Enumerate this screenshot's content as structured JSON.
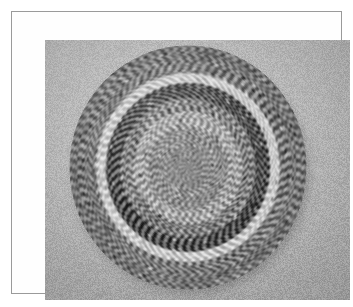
{
  "plate": {
    "kind": "photographic-plate",
    "caption": "",
    "frame_color": "#9a9a9a",
    "matte_color": "#fefefe",
    "photo_background_color": "#b2b2b2",
    "photo_rect": {
      "x": 33,
      "y": 28,
      "width": 305,
      "height": 260
    }
  },
  "subject": {
    "name": "braided-round-rug",
    "description": "Black-and-white photograph of a circular braided rag rug lying flat on a plain light-gray ground, viewed slightly from above so the disc reads as a wide ellipse.",
    "shape": "circle",
    "center": {
      "x": 176,
      "y": 155
    },
    "radius_x": 119,
    "radius_y": 122,
    "texture": "dense alternating light/dark braided chevron stitches running radially, giving a checkerboard speckle",
    "tone_range": {
      "darkest": "#141414",
      "lightest": "#f2f2f2",
      "mid": "#8d8d8d"
    }
  },
  "rug_bands": [
    {
      "index": 0,
      "name": "center-rosette",
      "r_inner": 0.0,
      "r_outer": 0.18,
      "tone": 0.52,
      "contrast": 0.3,
      "cell": 2.6,
      "label": "fine mottled gray hub"
    },
    {
      "index": 1,
      "name": "inner-mid-ring",
      "r_inner": 0.18,
      "r_outer": 0.34,
      "tone": 0.55,
      "contrast": 0.46,
      "cell": 3.2,
      "label": "light-gray speckled ring"
    },
    {
      "index": 2,
      "name": "inner-light-ring",
      "r_inner": 0.34,
      "r_outer": 0.46,
      "tone": 0.66,
      "contrast": 0.52,
      "cell": 3.4,
      "label": "pale ring with scattered dark stitches"
    },
    {
      "index": 3,
      "name": "mid-gray-ring",
      "r_inner": 0.46,
      "r_outer": 0.58,
      "tone": 0.5,
      "contrast": 0.58,
      "cell": 3.5,
      "label": "medium gray band"
    },
    {
      "index": 4,
      "name": "dark-ring",
      "r_inner": 0.58,
      "r_outer": 0.7,
      "tone": 0.22,
      "contrast": 0.78,
      "cell": 3.6,
      "label": "bold near-black ring, strongest contrast"
    },
    {
      "index": 5,
      "name": "white-ring",
      "r_inner": 0.7,
      "r_outer": 0.78,
      "tone": 0.84,
      "contrast": 0.4,
      "cell": 3.2,
      "label": "bright white highlight ring"
    },
    {
      "index": 6,
      "name": "outer-mid-ring",
      "r_inner": 0.78,
      "r_outer": 0.9,
      "tone": 0.47,
      "contrast": 0.5,
      "cell": 3.0,
      "label": "medium gray outer field"
    },
    {
      "index": 7,
      "name": "outer-speckle-border",
      "r_inner": 0.9,
      "r_outer": 1.0,
      "tone": 0.44,
      "contrast": 0.44,
      "cell": 2.6,
      "label": "fine dark-and-light speckled rim"
    }
  ],
  "render": {
    "stitch_spokes": 168,
    "stitch_rings": 74,
    "grain_amount": 0.3,
    "vignette": true
  }
}
